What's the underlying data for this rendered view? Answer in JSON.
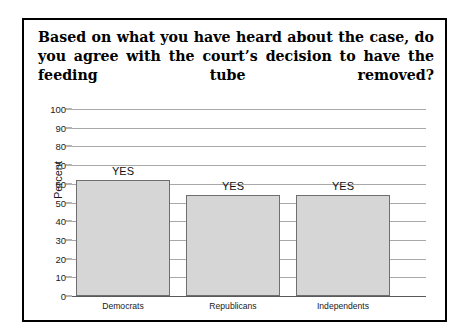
{
  "figure": {
    "title": "Based on what you have heard about the case, do you agree with the court’s decision to have the feeding tube removed?",
    "border_color": "#000000",
    "background": "#ffffff"
  },
  "chart_data": {
    "type": "bar",
    "title": "",
    "xlabel": "",
    "ylabel": "Percent",
    "categories": [
      "Democrats",
      "Republicans",
      "Independents"
    ],
    "values": [
      62,
      54,
      54
    ],
    "bar_labels": [
      "YES",
      "YES",
      "YES"
    ],
    "ylim": [
      0,
      100
    ],
    "ytick_labels": [
      "100",
      "90",
      "80",
      "70",
      "60",
      "50",
      "40",
      "30",
      "20",
      "10",
      "0"
    ],
    "ytick_values": [
      100,
      90,
      80,
      70,
      60,
      50,
      40,
      30,
      20,
      10,
      0
    ],
    "grid": true,
    "legend": "none",
    "bar_fill_color": "#d6d6d6",
    "bar_border_color": "#6e6e6e",
    "gridline_color": "#a8a8a8"
  }
}
